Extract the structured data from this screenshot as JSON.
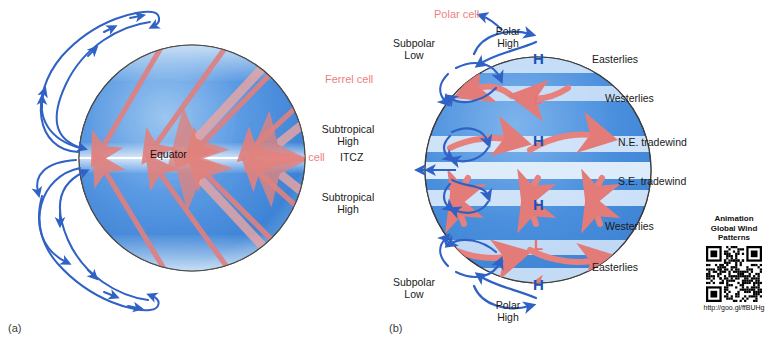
{
  "figure": {
    "width": 782,
    "height": 341,
    "background": "#ffffff"
  },
  "colors": {
    "globe_blue_dark": "#3a86d8",
    "globe_blue_light": "#b9d6f2",
    "globe_edge": "#555555",
    "wind_arrow_red": "#e8817d",
    "cell_arrow_blue": "#2f62c4",
    "cell_label_pink": "#ef7f7f",
    "high_blue": "#1b52b8",
    "low_red": "#e8736f",
    "text_black": "#1a1a1a"
  },
  "panel_a": {
    "label": "(a)",
    "equator_label": "Equator",
    "description": "Idealized globe with red surface wind arrows deflected by Coriolis effect and blue meridional circulation loops on the limb"
  },
  "panel_b": {
    "label": "(b)",
    "cells": [
      {
        "name": "Polar cell",
        "position": "top"
      },
      {
        "name": "Ferrel cell",
        "position": "upper-left"
      },
      {
        "name": "Hadley cell",
        "position": "middle-left"
      }
    ],
    "left_labels": [
      {
        "text": "Subpolar\nLow"
      },
      {
        "text": "Subtropical\nHigh"
      },
      {
        "text": "ITCZ"
      },
      {
        "text": "Subtropical\nHigh"
      },
      {
        "text": "Subpolar\nLow"
      }
    ],
    "top_label": "Polar\nHigh",
    "bottom_label": "Polar\nHigh",
    "right_labels": [
      {
        "text": "Easterlies"
      },
      {
        "text": "Westerlies"
      },
      {
        "text": "N.E. tradewind"
      },
      {
        "text": "S.E. tradewind"
      },
      {
        "text": "Westerlies"
      },
      {
        "text": "Easterlies"
      }
    ],
    "pressure_markers": [
      {
        "symbol": "H",
        "type": "high",
        "latitude": "north-pole"
      },
      {
        "symbol": "L",
        "type": "low",
        "latitude": "north-subpolar"
      },
      {
        "symbol": "H",
        "type": "high",
        "latitude": "north-subtropical"
      },
      {
        "symbol": "H",
        "type": "high",
        "latitude": "south-subtropical"
      },
      {
        "symbol": "L",
        "type": "low",
        "latitude": "south-subpolar"
      },
      {
        "symbol": "H",
        "type": "high",
        "latitude": "south-pole"
      }
    ]
  },
  "qr": {
    "caption": "Animation\nGlobal Wind\nPatterns",
    "url": "http://goo.gl/ffBUHg"
  }
}
